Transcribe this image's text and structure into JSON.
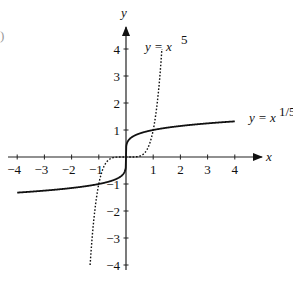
{
  "edge_fragment": ")",
  "chart_data": {
    "type": "line",
    "title": "",
    "xlabel": "x",
    "ylabel": "y",
    "xlim": [
      -4,
      4
    ],
    "ylim": [
      -4,
      4
    ],
    "grid": false,
    "x_ticks": [
      "-4",
      "-3",
      "-2",
      "-1",
      "1",
      "2",
      "3",
      "4"
    ],
    "y_ticks": [
      "4",
      "3",
      "2",
      "1",
      "-1",
      "-2",
      "-3",
      "-4"
    ],
    "series": [
      {
        "name": "y = x^(1/5)",
        "style": "solid",
        "label_text": "y = x",
        "label_exp": "1/5",
        "x": [
          -4,
          -3,
          -2,
          -1,
          -0.5,
          -0.1,
          -0.01,
          0,
          0.01,
          0.1,
          0.5,
          1,
          2,
          3,
          4
        ],
        "y": [
          -1.32,
          -1.25,
          -1.15,
          -1,
          -0.87,
          -0.63,
          -0.4,
          0,
          0.4,
          0.63,
          0.87,
          1,
          1.15,
          1.25,
          1.32
        ]
      },
      {
        "name": "y = x^5",
        "style": "dotted",
        "label_text": "y = x",
        "label_exp": "5",
        "x": [
          -1.32,
          -1.2,
          -1,
          -0.8,
          -0.5,
          0,
          0.5,
          0.8,
          1,
          1.2,
          1.32
        ],
        "y": [
          -4,
          -2.49,
          -1,
          -0.33,
          -0.03,
          0,
          0.03,
          0.33,
          1,
          2.49,
          4
        ]
      }
    ],
    "legend": "inline labels near curves"
  }
}
